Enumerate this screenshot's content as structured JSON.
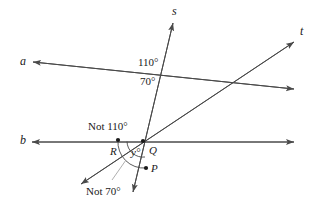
{
  "figure": {
    "type": "geometry-diagram",
    "background_color": "#ffffff",
    "line_color": "#4a4a4a",
    "text_color": "#1a1a1a"
  },
  "lines": [
    {
      "id": "a",
      "label": "a",
      "label_x": 20,
      "label_y": 55,
      "arrows": "both"
    },
    {
      "id": "b",
      "label": "b",
      "label_x": 20,
      "label_y": 134,
      "arrows": "both"
    },
    {
      "id": "s",
      "label": "s",
      "label_x": 172,
      "label_y": 5,
      "arrows": "both"
    },
    {
      "id": "t",
      "label": "t",
      "label_x": 300,
      "label_y": 25,
      "arrows": "both"
    }
  ],
  "points": [
    {
      "id": "R",
      "label": "R",
      "x": 118,
      "y": 140,
      "label_x": 110,
      "label_y": 146
    },
    {
      "id": "Q",
      "label": "Q",
      "x": 143,
      "y": 141,
      "label_x": 149,
      "label_y": 145
    },
    {
      "id": "P",
      "label": "P",
      "x": 146,
      "y": 168,
      "label_x": 151,
      "label_y": 163
    }
  ],
  "angle_labels": [
    {
      "id": "upper-110",
      "text": "110°",
      "x": 138,
      "y": 57
    },
    {
      "id": "upper-70",
      "text": "70°",
      "x": 140,
      "y": 76
    },
    {
      "id": "not-110",
      "text": "Not 110°",
      "x": 88,
      "y": 121
    },
    {
      "id": "y-angle",
      "text": "y°",
      "x": 131,
      "y": 147
    },
    {
      "id": "not-70",
      "text": "Not 70°",
      "x": 86,
      "y": 186
    }
  ],
  "values": {
    "angle_110": "110°",
    "angle_70": "70°",
    "angle_unknown": "y°",
    "not_110": "Not 110°",
    "not_70": "Not 70°"
  }
}
